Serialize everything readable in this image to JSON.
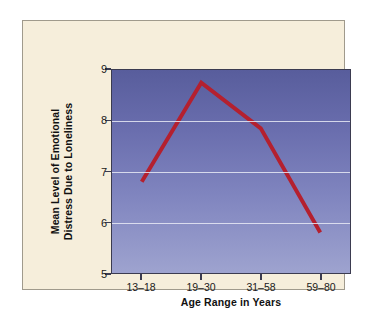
{
  "chart_data": {
    "type": "line",
    "title": "",
    "subtitle": "",
    "xlabel": "Age Range in Years",
    "ylabel_line1": "Mean Level of Emotional",
    "ylabel_line2": "Distress Due to Loneliness",
    "ylabel": "Mean Level of Emotional Distress Due to Loneliness",
    "categories": [
      "13–18",
      "19–30",
      "31–58",
      "59–80"
    ],
    "values": [
      6.8,
      8.75,
      7.85,
      5.8
    ],
    "series": [
      {
        "name": "Mean Level of Emotional Distress Due to Loneliness",
        "values": [
          6.8,
          8.75,
          7.85,
          5.8
        ]
      }
    ],
    "ylim": [
      5,
      9
    ],
    "yticks": [
      5,
      6,
      7,
      8,
      9
    ],
    "ytick_labels": [
      "5",
      "6",
      "7",
      "8",
      "9"
    ],
    "gridlines_y": [
      6,
      7,
      8
    ],
    "grid": true,
    "legend": false,
    "legend_position": "none",
    "line_color": "#b4202f",
    "line_width": 4,
    "markers": false,
    "plot_background_top": "#585d9c",
    "plot_background_bottom": "#9ea3cf",
    "gridline_color": "#e8eaf5",
    "panel_background": "#f6eedb",
    "axis_color": "#3b3b50",
    "text_color": "#111111"
  }
}
